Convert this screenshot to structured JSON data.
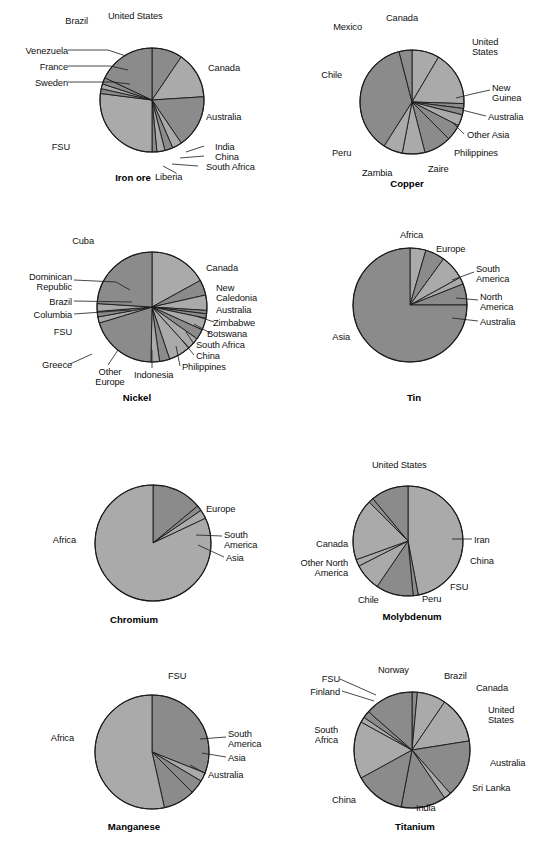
{
  "page": {
    "background": "#ffffff",
    "width": 552,
    "height": 843,
    "colors": {
      "slice_dark": "#8b8b8b",
      "slice_light": "#aaaaaa",
      "slice_mid": "#9a9a9a",
      "outline": "#1a1a1a",
      "text": "#111111"
    }
  },
  "chart_data": [
    {
      "type": "pie",
      "title": "Iron ore",
      "id": "iron-ore",
      "center": [
        152,
        100
      ],
      "radius": 52,
      "start_angle": -90,
      "legend": "callout-labels",
      "categories": [
        "United States",
        "Canada",
        "Australia",
        "India",
        "China",
        "South Africa",
        "Liberia",
        "FSU",
        "Sweden",
        "France",
        "Venezuela",
        "Brazil"
      ],
      "values": [
        9.5,
        14.5,
        16.5,
        3.0,
        2.5,
        2.5,
        1.5,
        27.0,
        1.5,
        1.5,
        2.0,
        18.0
      ],
      "shades": [
        "dark",
        "light",
        "dark",
        "light",
        "dark",
        "light",
        "dark",
        "light",
        "dark",
        "light",
        "dark",
        "dark"
      ]
    },
    {
      "type": "pie",
      "title": "Copper",
      "id": "copper",
      "center": [
        412,
        102
      ],
      "radius": 52,
      "start_angle": -90,
      "legend": "callout-labels",
      "categories": [
        "Canada",
        "United States",
        "New Guinea",
        "Australia",
        "Other Asia",
        "Philippines",
        "Zaire",
        "Zambia",
        "Peru",
        "Chile",
        "Mexico"
      ],
      "values": [
        8.5,
        17.0,
        1.5,
        2.0,
        3.5,
        5.0,
        8.5,
        7.0,
        6.0,
        37.0,
        4.0
      ],
      "shades": [
        "light",
        "light",
        "dark",
        "dark",
        "light",
        "dark",
        "dark",
        "light",
        "light",
        "dark",
        "dark"
      ]
    },
    {
      "type": "pie",
      "title": "Nickel",
      "id": "nickel",
      "center": [
        152,
        307
      ],
      "radius": 55,
      "start_angle": -90,
      "legend": "callout-labels",
      "categories": [
        "Canada",
        "New Caledonia",
        "Australia",
        "Zimbabwe",
        "Botswana",
        "South Africa",
        "China",
        "Philippines",
        "Indonesia",
        "Other Europe",
        "Greece",
        "FSU",
        "Columbia",
        "Brazil",
        "Dominican Republic",
        "Cuba"
      ],
      "values": [
        17.0,
        4.5,
        4.5,
        1.0,
        1.3,
        3.5,
        3.0,
        3.5,
        6.5,
        3.0,
        2.5,
        20.0,
        1.8,
        1.6,
        2.3,
        24.0
      ],
      "shades": [
        "light",
        "dark",
        "light",
        "dark",
        "dark",
        "light",
        "dark",
        "light",
        "light",
        "dark",
        "light",
        "dark",
        "light",
        "dark",
        "light",
        "dark"
      ]
    },
    {
      "type": "pie",
      "title": "Tin",
      "id": "tin",
      "center": [
        410,
        305
      ],
      "radius": 57,
      "start_angle": -90,
      "legend": "callout-labels",
      "categories": [
        "Africa",
        "Europe",
        "South America",
        "North America",
        "Australia",
        "Asia"
      ],
      "values": [
        4.5,
        5.5,
        7.0,
        2.0,
        6.0,
        75.0
      ],
      "shades": [
        "light",
        "dark",
        "light",
        "light",
        "dark",
        "dark"
      ]
    },
    {
      "type": "pie",
      "title": "Chromium",
      "id": "chromium",
      "center": [
        153,
        543
      ],
      "radius": 58,
      "start_angle": -90,
      "legend": "callout-labels",
      "categories": [
        "Europe",
        "South America",
        "Asia",
        "Africa"
      ],
      "values": [
        14.0,
        1.5,
        2.5,
        82.0
      ],
      "shades": [
        "dark",
        "dark",
        "light",
        "light"
      ]
    },
    {
      "type": "pie",
      "title": "Molybdenum",
      "id": "molybdenum",
      "center": [
        408,
        541
      ],
      "radius": 55,
      "start_angle": -90,
      "legend": "callout-labels",
      "categories": [
        "United States",
        "Iran",
        "China",
        "FSU",
        "Peru",
        "Chile",
        "Other North America",
        "Canada"
      ],
      "values": [
        47.0,
        1.5,
        11.0,
        8.0,
        2.0,
        18.0,
        1.5,
        11.0
      ],
      "shades": [
        "light",
        "dark",
        "dark",
        "light",
        "light",
        "light",
        "dark",
        "dark"
      ]
    },
    {
      "type": "pie",
      "title": "Manganese",
      "id": "manganese",
      "center": [
        152,
        752
      ],
      "radius": 57,
      "start_angle": -90,
      "legend": "callout-labels",
      "categories": [
        "FSU",
        "South America",
        "Asia",
        "Australia",
        "Africa"
      ],
      "values": [
        31.0,
        2.5,
        4.0,
        9.0,
        53.5
      ],
      "shades": [
        "dark",
        "light",
        "dark",
        "dark",
        "light"
      ]
    },
    {
      "type": "pie",
      "title": "Titanium",
      "id": "titanium",
      "center": [
        412,
        750
      ],
      "radius": 58,
      "start_angle": -90,
      "legend": "callout-labels",
      "categories": [
        "Brazil",
        "Canada",
        "United States",
        "Australia",
        "Sri Lanka",
        "India",
        "China",
        "South Africa",
        "Finland",
        "FSU",
        "Norway"
      ],
      "values": [
        1.5,
        8.0,
        13.0,
        16.0,
        2.0,
        12.5,
        14.0,
        16.0,
        1.5,
        2.0,
        13.5
      ],
      "shades": [
        "dark",
        "light",
        "light",
        "dark",
        "light",
        "dark",
        "dark",
        "light",
        "light",
        "dark",
        "dark"
      ]
    }
  ],
  "charts": {
    "iron_ore": {
      "title": "Iron ore",
      "labels": {
        "united_states": "United States",
        "canada": "Canada",
        "australia": "Australia",
        "india": "India",
        "china": "China",
        "south_africa": "South Africa",
        "liberia": "Liberia",
        "fsu": "FSU",
        "sweden": "Sweden",
        "france": "France",
        "venezuela": "Venezuela",
        "brazil": "Brazil"
      }
    },
    "copper": {
      "title": "Copper",
      "labels": {
        "canada": "Canada",
        "united_states": "United\nStates",
        "new_guinea": "New\nGuinea",
        "australia": "Australia",
        "other_asia": "Other Asia",
        "philippines": "Philippines",
        "zaire": "Zaire",
        "zambia": "Zambia",
        "peru": "Peru",
        "chile": "Chile",
        "mexico": "Mexico"
      }
    },
    "nickel": {
      "title": "Nickel",
      "labels": {
        "canada": "Canada",
        "new_caledonia": "New\nCaledonia",
        "australia": "Australia",
        "zimbabwe": "Zimbabwe",
        "botswana": "Botswana",
        "south_africa": "South Africa",
        "china": "China",
        "philippines": "Philippines",
        "indonesia": "Indonesia",
        "other_europe": "Other\nEurope",
        "greece": "Greece",
        "fsu": "FSU",
        "columbia": "Columbia",
        "brazil": "Brazil",
        "dominican_republic": "Dominican\nRepublic",
        "cuba": "Cuba"
      }
    },
    "tin": {
      "title": "Tin",
      "labels": {
        "africa": "Africa",
        "europe": "Europe",
        "south_america": "South\nAmerica",
        "north_america": "North\nAmerica",
        "australia": "Australia",
        "asia": "Asia"
      }
    },
    "chromium": {
      "title": "Chromium",
      "labels": {
        "europe": "Europe",
        "south_america": "South\nAmerica",
        "asia": "Asia",
        "africa": "Africa"
      }
    },
    "molybdenum": {
      "title": "Molybdenum",
      "labels": {
        "united_states": "United States",
        "iran": "Iran",
        "china": "China",
        "fsu": "FSU",
        "peru": "Peru",
        "chile": "Chile",
        "other_north_america": "Other North\nAmerica",
        "canada": "Canada"
      }
    },
    "manganese": {
      "title": "Manganese",
      "labels": {
        "fsu": "FSU",
        "south_america": "South\nAmerica",
        "asia": "Asia",
        "australia": "Australia",
        "africa": "Africa"
      }
    },
    "titanium": {
      "title": "Titanium",
      "labels": {
        "norway": "Norway",
        "brazil": "Brazil",
        "canada": "Canada",
        "united_states": "United\nStates",
        "australia": "Australia",
        "sri_lanka": "Sri Lanka",
        "india": "India",
        "china": "China",
        "south_africa": "South\nAfrica",
        "finland": "Finland",
        "fsu": "FSU"
      }
    }
  }
}
